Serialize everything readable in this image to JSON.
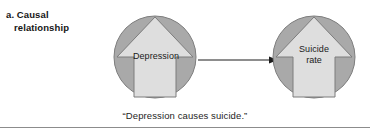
{
  "panel": {
    "label_line1": "a. Causal",
    "label_line2": "relationship"
  },
  "nodes": [
    {
      "id": "depression",
      "label_line1": "Depression",
      "label_line2": ""
    },
    {
      "id": "suicide-rate",
      "label_line1": "Suicide",
      "label_line2": "rate"
    }
  ],
  "connector": {
    "direction": "right",
    "from": "depression",
    "to": "suicide-rate"
  },
  "caption": "“Depression causes suicide.”",
  "colors": {
    "circle_fill": "#a9a9a9",
    "circle_stroke": "#7d7d7d",
    "arrow_shape_fill": "#dedede",
    "arrow_shape_stroke": "#7d7d7d",
    "connector": "#1c1c1c",
    "rule": "#8c8c8c",
    "text": "#1a1a1a",
    "background": "#ffffff"
  }
}
